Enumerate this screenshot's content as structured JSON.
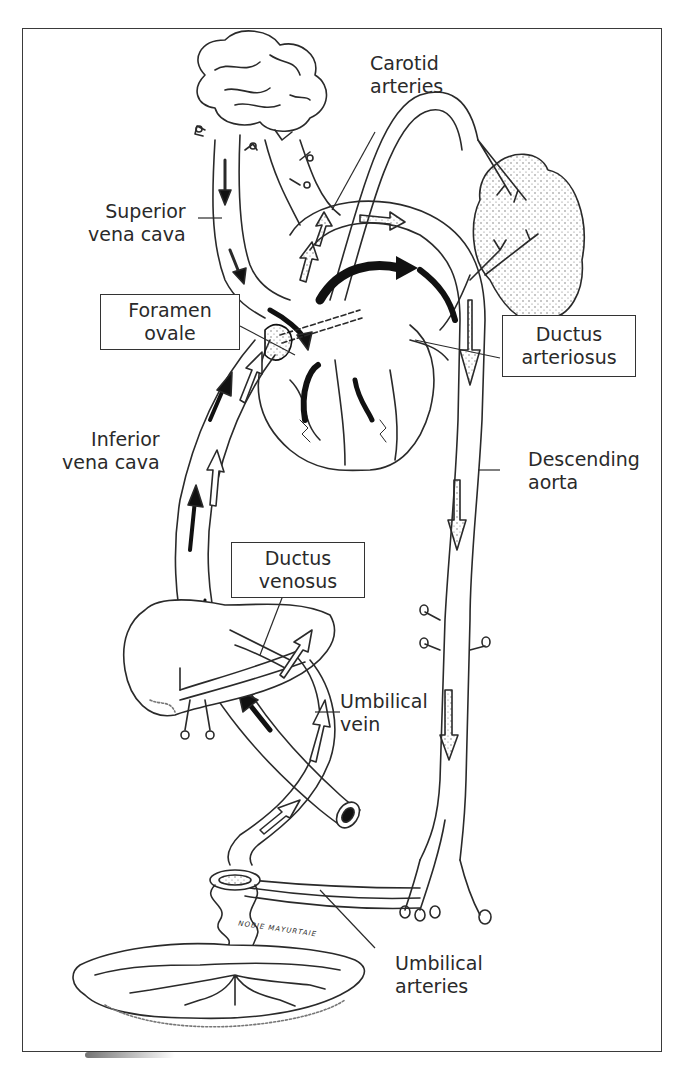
{
  "figure": {
    "labels": {
      "carotid_arteries": {
        "line1": "Carotid",
        "line2": "arteries"
      },
      "superior_vena_cava": {
        "line1": "Superior",
        "line2": "vena cava"
      },
      "foramen_ovale": {
        "line1": "Foramen",
        "line2": "ovale"
      },
      "ductus_arteriosus": {
        "line1": "Ductus",
        "line2": "arteriosus"
      },
      "inferior_vena_cava": {
        "line1": "Inferior",
        "line2": "vena cava"
      },
      "descending_aorta": {
        "line1": "Descending",
        "line2": "aorta"
      },
      "ductus_venosus": {
        "line1": "Ductus",
        "line2": "venosus"
      },
      "umbilical_vein": {
        "line1": "Umbilical",
        "line2": "vein"
      },
      "umbilical_arteries": {
        "line1": "Umbilical",
        "line2": "arteries"
      }
    },
    "artist_signature": "NOBIE MAYURTAIE",
    "structures": [
      "brain",
      "lungs",
      "heart",
      "liver",
      "placenta",
      "umbilical cord",
      "aorta",
      "vena cava"
    ],
    "colors": {
      "ink": "#2a2a2a",
      "background": "#ffffff",
      "oxygenated_arrow": "#111111",
      "stipple": "#666666"
    }
  }
}
